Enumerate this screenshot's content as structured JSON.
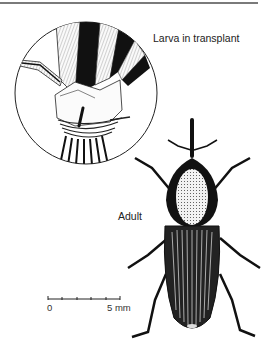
{
  "figure": {
    "labels": {
      "inset": "Larva in transplant",
      "main": "Adult"
    },
    "scale_bar": {
      "min_label": "0",
      "max_label": "5 mm",
      "ticks": 5
    },
    "illustrations": [
      {
        "name": "larva-in-transplant-inset",
        "shape": "circle",
        "subject": "rice transplant stem with larva boring into base"
      },
      {
        "name": "adult-weevil",
        "subject": "adult weevil, dorsal view, with striated elytra and dotted pronotum"
      }
    ],
    "colors": {
      "ink": "#111111",
      "background": "#ffffff",
      "rule": "#7a7a7a"
    }
  }
}
